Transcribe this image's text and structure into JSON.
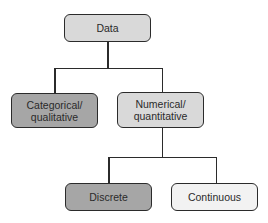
{
  "diagram": {
    "type": "tree",
    "nodes": {
      "root": {
        "label": "Data",
        "fill": "#d9d9d9"
      },
      "categorical": {
        "label_line1": "Categorical/",
        "label_line2": "qualitative",
        "fill": "#a6a6a6"
      },
      "numerical": {
        "label_line1": "Numerical/",
        "label_line2": "quantitative",
        "fill": "#d9d9d9"
      },
      "discrete": {
        "label": "Discrete",
        "fill": "#a6a6a6"
      },
      "continuous": {
        "label": "Continuous",
        "fill": "#f2f2f2"
      }
    },
    "edges": [
      [
        "Data",
        "Categorical/qualitative"
      ],
      [
        "Data",
        "Numerical/quantitative"
      ],
      [
        "Numerical/quantitative",
        "Discrete"
      ],
      [
        "Numerical/quantitative",
        "Continuous"
      ]
    ]
  }
}
